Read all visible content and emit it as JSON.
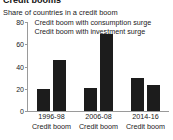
{
  "header": {
    "title_cutoff": "Credit booms",
    "subtitle": "Share of countries in a credit boom"
  },
  "colors": {
    "bar": "#1c1c1c",
    "axis": "#9a9a9a",
    "text": "#1a1a1a",
    "background": "#ffffff"
  },
  "chart_data": {
    "type": "bar",
    "title": "Credit booms",
    "subtitle": "Share of countries in a credit boom",
    "xlabel": "",
    "ylabel": "",
    "ylim": [
      0,
      80
    ],
    "yticks": [
      0,
      20,
      40,
      60,
      80
    ],
    "ytick_labels": [
      "0",
      "20",
      "40",
      "60",
      "80"
    ],
    "grid": false,
    "legend_position": "top-left",
    "categories": [
      "1996-98",
      "2006-08",
      "2014-16"
    ],
    "category_sublabels": [
      "Credit boom",
      "Credit boom",
      "Credit boom"
    ],
    "series": [
      {
        "name": "Credit boom with consumption surge",
        "color": "#1c1c1c",
        "values": [
          20,
          21,
          30
        ]
      },
      {
        "name": "Credit boom with investment surge",
        "color": "#1c1c1c",
        "values": [
          46,
          69,
          23
        ]
      }
    ]
  }
}
